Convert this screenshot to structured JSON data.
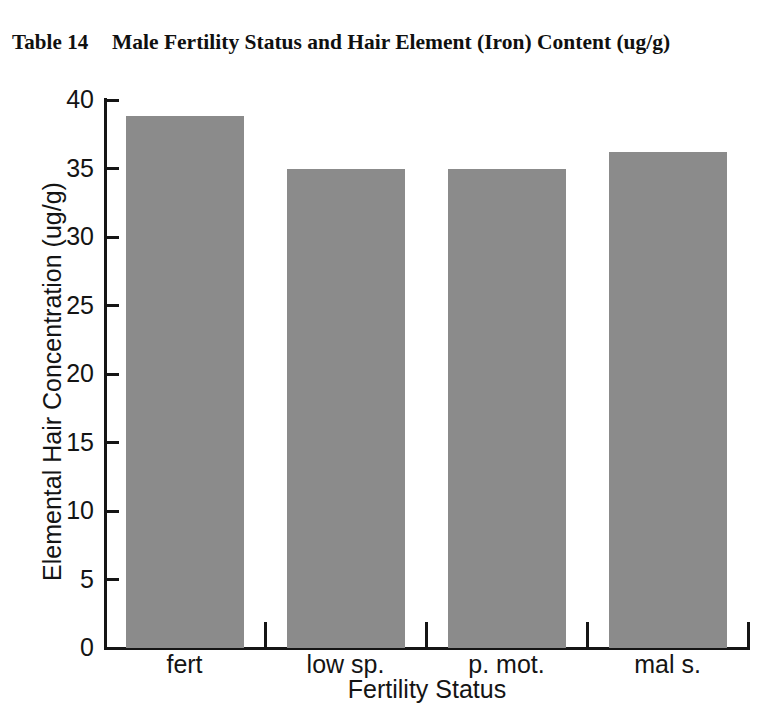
{
  "title": {
    "table_number": "Table 14",
    "caption": "Male Fertility Status and Hair Element (Iron) Content (ug/g)"
  },
  "chart_data": {
    "type": "bar",
    "title": "Male Fertility Status and Hair Element (Iron) Content (ug/g)",
    "categories": [
      "fert",
      "low sp.",
      "p. mot.",
      "mal s."
    ],
    "values": [
      38.8,
      35.0,
      35.0,
      36.2
    ],
    "xlabel": "Fertility Status",
    "ylabel": "Elemental Hair Concentration (ug/g)",
    "ylim": [
      0,
      40
    ],
    "ytick_labels": [
      "40",
      "35",
      "30",
      "25",
      "20",
      "15",
      "10",
      "5",
      "0"
    ],
    "ytick_values": [
      40,
      35,
      30,
      25,
      20,
      15,
      10,
      5,
      0
    ],
    "grid": false,
    "legend": false,
    "bar_color": "#8b8b8b",
    "axis_color": "#151515"
  }
}
